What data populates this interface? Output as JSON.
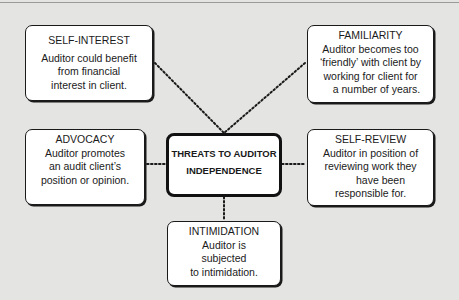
{
  "diagram": {
    "title": "THREATS TO AUDITOR INDEPENDENCE",
    "center": {
      "line1": "THREATS TO AUDITOR",
      "line2": "INDEPENDENCE"
    },
    "threats": {
      "self_interest": {
        "title": "SELF-INTEREST",
        "lines": [
          "Auditor could benefit",
          "from financial",
          "interest in client."
        ]
      },
      "familiarity": {
        "title": "FAMILIARITY",
        "lines": [
          "Auditor becomes too",
          "‘friendly’ with client by",
          "working for client for",
          "a number of years."
        ]
      },
      "advocacy": {
        "title": "ADVOCACY",
        "lines": [
          "Auditor promotes",
          "an audit client’s",
          "position or opinion."
        ]
      },
      "self_review": {
        "title": "SELF-REVIEW",
        "lines": [
          "Auditor in position of",
          "reviewing work they",
          "have been",
          "responsible for."
        ]
      },
      "intimidation": {
        "title": "INTIMIDATION",
        "lines": [
          "Auditor is",
          "subjected",
          "to intimidation."
        ]
      }
    },
    "connector_style": "dotted",
    "colors": {
      "background": "#e4e4e2",
      "box_fill": "#ffffff",
      "border": "#1a1a1a"
    }
  }
}
